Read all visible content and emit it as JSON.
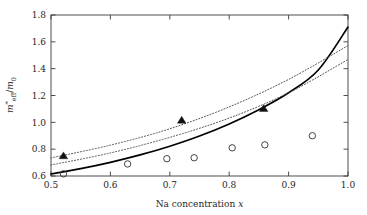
{
  "chart_data": {
    "type": "scatter",
    "title": "",
    "xlabel": "Na concentration x",
    "ylabel": "m*_eff/m_0",
    "ylabel_parts": {
      "base": "m",
      "sup": "*",
      "sub": "eff",
      "denom_base": "m",
      "denom_sub": "0",
      "slash": "/"
    },
    "xlabel_parts": {
      "text": "Na concentration",
      "italic_var": "x"
    },
    "xlim": [
      0.5,
      1.0
    ],
    "ylim": [
      0.6,
      1.8
    ],
    "xticks": [
      "0.5",
      "0.6",
      "0.7",
      "0.8",
      "0.9",
      "1.0"
    ],
    "xtick_values": [
      0.5,
      0.6,
      0.7,
      0.8,
      0.9,
      1.0
    ],
    "yticks": [
      "0.6",
      "0.8",
      "1.0",
      "1.2",
      "1.4",
      "1.6",
      "1.8"
    ],
    "ytick_values": [
      0.6,
      0.8,
      1.0,
      1.2,
      1.4,
      1.6,
      1.8
    ],
    "grid": false,
    "legend": "none",
    "frame": "box",
    "series": [
      {
        "name": "filled-triangles",
        "marker": "triangle-filled",
        "color": "#111111",
        "points": [
          {
            "x": 0.521,
            "y": 0.75
          },
          {
            "x": 0.72,
            "y": 1.015
          },
          {
            "x": 0.858,
            "y": 1.102
          }
        ]
      },
      {
        "name": "open-circles",
        "marker": "circle-open",
        "color": "#3a3a3a",
        "points": [
          {
            "x": 0.521,
            "y": 0.616
          },
          {
            "x": 0.629,
            "y": 0.69
          },
          {
            "x": 0.695,
            "y": 0.729
          },
          {
            "x": 0.741,
            "y": 0.736
          },
          {
            "x": 0.805,
            "y": 0.81
          },
          {
            "x": 0.86,
            "y": 0.832
          },
          {
            "x": 0.94,
            "y": 0.9
          }
        ]
      },
      {
        "name": "solid-curve",
        "marker": "none",
        "style": "solid",
        "color": "#000000",
        "points": [
          {
            "x": 0.5,
            "y": 0.615
          },
          {
            "x": 0.55,
            "y": 0.655
          },
          {
            "x": 0.6,
            "y": 0.702
          },
          {
            "x": 0.65,
            "y": 0.757
          },
          {
            "x": 0.7,
            "y": 0.822
          },
          {
            "x": 0.75,
            "y": 0.898
          },
          {
            "x": 0.8,
            "y": 0.988
          },
          {
            "x": 0.85,
            "y": 1.094
          },
          {
            "x": 0.9,
            "y": 1.22
          },
          {
            "x": 0.95,
            "y": 1.39
          },
          {
            "x": 1.0,
            "y": 1.71
          }
        ]
      },
      {
        "name": "dotted-curve-upper",
        "marker": "none",
        "style": "dotted",
        "color": "#555555",
        "points": [
          {
            "x": 0.5,
            "y": 0.735
          },
          {
            "x": 0.6,
            "y": 0.83
          },
          {
            "x": 0.7,
            "y": 0.952
          },
          {
            "x": 0.8,
            "y": 1.115
          },
          {
            "x": 0.9,
            "y": 1.32
          },
          {
            "x": 1.0,
            "y": 1.572
          }
        ]
      },
      {
        "name": "dotted-curve-lower",
        "marker": "none",
        "style": "dotted",
        "color": "#555555",
        "points": [
          {
            "x": 0.5,
            "y": 0.682
          },
          {
            "x": 0.6,
            "y": 0.772
          },
          {
            "x": 0.7,
            "y": 0.888
          },
          {
            "x": 0.8,
            "y": 1.032
          },
          {
            "x": 0.9,
            "y": 1.22
          },
          {
            "x": 1.0,
            "y": 1.468
          }
        ]
      }
    ]
  }
}
